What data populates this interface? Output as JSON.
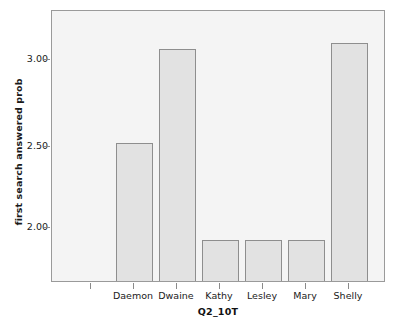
{
  "chart_data": {
    "type": "bar",
    "title": "",
    "xlabel": "Q2_10T",
    "ylabel": "first search answered prob",
    "categories": [
      "Daemon",
      "Dwaine",
      "Kathy",
      "Lesley",
      "Mary",
      "Shelly"
    ],
    "values": [
      2.5,
      2.99,
      2.0,
      2.0,
      2.0,
      3.02
    ],
    "ylim": [
      1.78,
      3.18
    ],
    "yticks": [
      2.0,
      2.5,
      3.0
    ],
    "ytick_labels": [
      "2.00",
      "2.50",
      "3.00"
    ],
    "xtick_labels": [
      "",
      "Daemon",
      "Dwaine",
      "Kathy",
      "Lesley",
      "Mary",
      "Shelly"
    ],
    "grid": false,
    "legend": null,
    "bar_fill_color": "#e2e2e2",
    "bar_edge_color": "#8e8e8e",
    "plot_background_color": "#f4f4f4",
    "frame_color": "#9a9a9a",
    "text_color": "#1a1a1a"
  }
}
